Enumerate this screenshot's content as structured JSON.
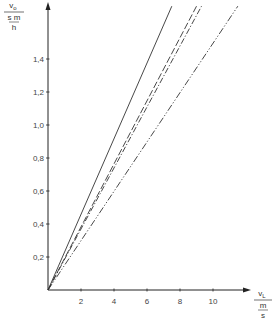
{
  "chart_data": {
    "type": "line",
    "title": "",
    "xlabel": "v_L / (m/s)",
    "ylabel": "v_o / (s m / h)",
    "xlabel_parts": {
      "symbol": "v",
      "sub": "L",
      "unit_num": "m",
      "unit_den": "s"
    },
    "ylabel_parts": {
      "symbol": "v",
      "sub": "o",
      "unit_num": "s m",
      "unit_den": "h"
    },
    "xlim": [
      0,
      12.2
    ],
    "ylim": [
      0,
      1.74
    ],
    "x_ticks": [
      2,
      4,
      6,
      8,
      10
    ],
    "x_tick_labels": [
      "2",
      "4",
      "6",
      "8",
      "10"
    ],
    "y_ticks": [
      0.2,
      0.4,
      0.6,
      0.8,
      1.0,
      1.2,
      1.4
    ],
    "y_tick_labels": [
      "0,2",
      "0,4",
      "0,6",
      "0,8",
      "1,0",
      "1,2",
      "1,4"
    ],
    "grid": false,
    "legend": null,
    "series": [
      {
        "name": "solid",
        "style": "solid",
        "x": [
          0,
          7.5
        ],
        "y": [
          0,
          1.72
        ]
      },
      {
        "name": "dashed",
        "style": "dashed",
        "x": [
          0,
          9.0
        ],
        "y": [
          0,
          1.72
        ]
      },
      {
        "name": "dash-dot",
        "style": "dashdot",
        "x": [
          0,
          9.3
        ],
        "y": [
          0,
          1.72
        ]
      },
      {
        "name": "dash-dot-dot",
        "style": "dashdotdot",
        "x": [
          0,
          11.5
        ],
        "y": [
          0,
          1.72
        ]
      }
    ]
  },
  "colors": {
    "line": "#333333",
    "axis": "#222222"
  }
}
